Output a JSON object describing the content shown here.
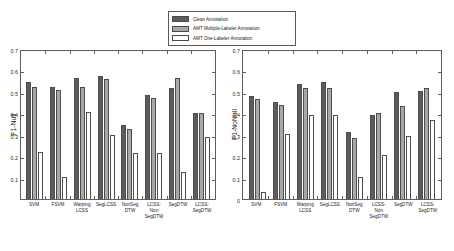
{
  "legend": {
    "position": "top-center",
    "items": [
      {
        "label": "Clean Annotation",
        "color": "#5c5c5c",
        "icon": "legend-swatch-icon"
      },
      {
        "label": "AMT Multiple-Labeler Annotation",
        "color": "#a8a8a8",
        "icon": "legend-swatch-icon"
      },
      {
        "label": "AMT One-Labeler Annotation",
        "color": "#ffffff",
        "icon": "legend-swatch-icon"
      }
    ]
  },
  "chart_data": [
    {
      "type": "bar",
      "panel": "left",
      "title": "",
      "xlabel": "",
      "ylabel": "F1-Null",
      "ylim": [
        0,
        0.7
      ],
      "yticks": [
        0.1,
        0.2,
        0.3,
        0.4,
        0.5,
        0.6,
        0.7
      ],
      "ytick_labels": [
        "0.1",
        "0.2",
        "0.3",
        "0.4",
        "0.5",
        "0.6",
        "0.7"
      ],
      "grid": false,
      "categories": [
        "SVM",
        "FSVM",
        "Warping LCSS",
        "SegLCSS",
        "NonSeg DTW",
        "LCSS-Non SegDTW",
        "SegDTW",
        "LCSS-SegDTW"
      ],
      "series": [
        {
          "name": "Clean Annotation",
          "color": "#5c5c5c",
          "values": [
            0.545,
            0.525,
            0.565,
            0.575,
            0.345,
            0.485,
            0.52,
            0.4
          ]
        },
        {
          "name": "AMT Multiple-Labeler Annotation",
          "color": "#a8a8a8",
          "values": [
            0.525,
            0.51,
            0.525,
            0.56,
            0.325,
            0.47,
            0.565,
            0.4
          ]
        },
        {
          "name": "AMT One-Labeler Annotation",
          "color": "#ffffff",
          "values": [
            0.22,
            0.105,
            0.405,
            0.3,
            0.215,
            0.215,
            0.125,
            0.29
          ]
        }
      ]
    },
    {
      "type": "bar",
      "panel": "right",
      "title": "",
      "xlabel": "",
      "ylabel": "F1-NoNull",
      "ylim": [
        0,
        0.7
      ],
      "yticks": [
        0,
        0.1,
        0.2,
        0.3,
        0.4,
        0.5,
        0.6,
        0.7
      ],
      "ytick_labels": [
        "0",
        "0.1",
        "0.2",
        "0.3",
        "0.4",
        "0.5",
        "0.6",
        "0.7"
      ],
      "grid": false,
      "categories": [
        "SVM",
        "FSVM",
        "Warping LCSS",
        "SegLCSS",
        "NonSeg DTW",
        "LCSS-Non SegDTW",
        "SegDTW",
        "LCSS-SegDTW"
      ],
      "series": [
        {
          "name": "Clean Annotation",
          "color": "#5c5c5c",
          "values": [
            0.48,
            0.455,
            0.535,
            0.545,
            0.315,
            0.39,
            0.5,
            0.505
          ]
        },
        {
          "name": "AMT Multiple-Labeler Annotation",
          "color": "#a8a8a8",
          "values": [
            0.465,
            0.44,
            0.52,
            0.52,
            0.285,
            0.4,
            0.435,
            0.52
          ]
        },
        {
          "name": "AMT One-Labeler Annotation",
          "color": "#ffffff",
          "values": [
            0.035,
            0.305,
            0.39,
            0.39,
            0.105,
            0.205,
            0.295,
            0.37
          ]
        }
      ]
    }
  ]
}
